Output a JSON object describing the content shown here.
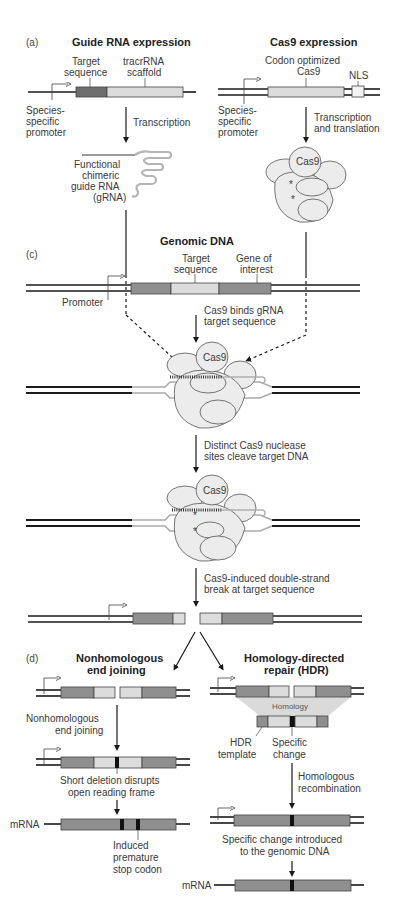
{
  "panel_a": {
    "label": "(a)",
    "guide": {
      "title": "Guide RNA expression",
      "target_label_1": "Target",
      "target_label_2": "sequence",
      "scaffold_label_1": "tracrRNA",
      "scaffold_label_2": "scaffold",
      "promoter_1": "Species-",
      "promoter_2": "specific",
      "promoter_3": "promoter",
      "step": "Transcription",
      "product_1": "Functional",
      "product_2": "chimeric",
      "product_3": "guide RNA",
      "product_4": "(gRNA)"
    },
    "cas9": {
      "title": "Cas9 expression",
      "gene_label_1": "Codon optimized",
      "gene_label_2": "Cas9",
      "nls_label": "NLS",
      "promoter_1": "Species-",
      "promoter_2": "specific",
      "promoter_3": "promoter",
      "step_1": "Transcription",
      "step_2": "and translation",
      "protein_label": "Cas9",
      "site_marker": "*"
    }
  },
  "panel_c": {
    "label": "(c)",
    "title": "Genomic DNA",
    "target_label_1": "Target",
    "target_label_2": "sequence",
    "gene_label_1": "Gene of",
    "gene_label_2": "interest",
    "promoter": "Promoter",
    "step1_1": "Cas9 binds gRNA",
    "step1_2": "target sequence",
    "complex_label": "Cas9",
    "step2_1": "Distinct Cas9 nuclease",
    "step2_2": "sites cleave target DNA",
    "cleaved_label": "Cas9",
    "step3_1": "Cas9-induced double-strand",
    "step3_2": "break at target sequence"
  },
  "panel_d": {
    "label": "(d)",
    "nhej": {
      "title_1": "Nonhomologous",
      "title_2": "end joining",
      "step_1": "Nonhomologous",
      "step_2": "end joining",
      "result_1": "Short deletion disrupts",
      "result_2": "open reading frame",
      "mrna_label": "mRNA",
      "stop_1": "Induced",
      "stop_2": "premature",
      "stop_3": "stop codon"
    },
    "hdr": {
      "title_1": "Homology-directed",
      "title_2": "repair (HDR)",
      "homology_label": "Homology",
      "template_1": "HDR",
      "template_2": "template",
      "change_1": "Specific",
      "change_2": "change",
      "step_1": "Homologous",
      "step_2": "recombination",
      "result_1": "Specific change introduced",
      "result_2": "to the genomic DNA",
      "mrna_label": "mRNA"
    }
  },
  "colors": {
    "gene_dark": "#8f8f8f",
    "gene_light": "#dcdcdc",
    "target_dark": "#6e6e6e",
    "protein_fill": "#ececec",
    "mutation": "#111111"
  }
}
